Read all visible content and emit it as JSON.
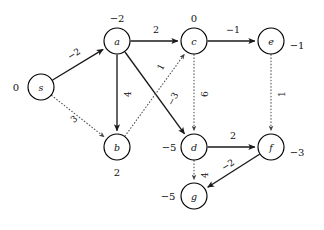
{
  "figure": {
    "background_color": "#ffffff",
    "solid_edge_color": "#1a1a1a",
    "dotted_edge_color": "#555555",
    "node_fill_color": "#ffffff",
    "node_stroke_color": "#000000"
  },
  "nodes": [
    {
      "id": "s",
      "name": "s",
      "value": "0",
      "cx": 41,
      "cy": 87,
      "r": 13,
      "value_x": 16,
      "value_y": 87
    },
    {
      "id": "a",
      "name": "a",
      "value": "−2",
      "cx": 117,
      "cy": 41,
      "r": 13,
      "value_x": 117,
      "value_y": 18
    },
    {
      "id": "b",
      "name": "b",
      "value": "2",
      "cx": 117,
      "cy": 147,
      "r": 13,
      "value_x": 117,
      "value_y": 172
    },
    {
      "id": "c",
      "name": "c",
      "value": "0",
      "cx": 194,
      "cy": 41,
      "r": 13,
      "value_x": 194,
      "value_y": 18
    },
    {
      "id": "d",
      "name": "d",
      "value": "−5",
      "cx": 194,
      "cy": 147,
      "r": 13,
      "value_x": 169,
      "value_y": 147
    },
    {
      "id": "e",
      "name": "e",
      "value": "−1",
      "cx": 271,
      "cy": 41,
      "r": 13,
      "value_x": 297,
      "value_y": 45
    },
    {
      "id": "f",
      "name": "f",
      "value": "−3",
      "cx": 271,
      "cy": 147,
      "r": 13,
      "value_x": 297,
      "value_y": 152
    },
    {
      "id": "g",
      "name": "g",
      "value": "−5",
      "cx": 194,
      "cy": 196,
      "r": 13,
      "value_x": 168,
      "value_y": 196
    }
  ],
  "edges": [
    {
      "id": "s-a",
      "from": "s",
      "to": "a",
      "weight": "−2",
      "style": "solid",
      "label_x": 74,
      "label_y": 54,
      "label_rotate": -32
    },
    {
      "id": "s-b",
      "from": "s",
      "to": "b",
      "weight": "3",
      "style": "dotted",
      "label_x": 74,
      "label_y": 119,
      "label_rotate": -40
    },
    {
      "id": "a-c",
      "from": "a",
      "to": "c",
      "weight": "2",
      "style": "solid",
      "label_x": 156,
      "label_y": 29,
      "label_rotate": 0
    },
    {
      "id": "a-b",
      "from": "a",
      "to": "b",
      "weight": "4",
      "style": "solid",
      "label_x": 128,
      "label_y": 94,
      "label_rotate": -90
    },
    {
      "id": "a-d",
      "from": "a",
      "to": "d",
      "weight": "−3",
      "style": "solid",
      "label_x": 173,
      "label_y": 99,
      "label_rotate": -62
    },
    {
      "id": "c-e",
      "from": "c",
      "to": "e",
      "weight": "−1",
      "style": "solid",
      "label_x": 233,
      "label_y": 29,
      "label_rotate": 0
    },
    {
      "id": "b-c",
      "from": "b",
      "to": "c",
      "weight": "1",
      "style": "dotted",
      "label_x": 161,
      "label_y": 67,
      "label_rotate": -62
    },
    {
      "id": "c-d",
      "from": "c",
      "to": "d",
      "weight": "6",
      "style": "dotted",
      "label_x": 205,
      "label_y": 94,
      "label_rotate": -90
    },
    {
      "id": "e-f",
      "from": "e",
      "to": "f",
      "weight": "1",
      "style": "dotted",
      "label_x": 282,
      "label_y": 94,
      "label_rotate": -90
    },
    {
      "id": "d-f",
      "from": "d",
      "to": "f",
      "weight": "2",
      "style": "solid",
      "label_x": 233,
      "label_y": 135,
      "label_rotate": 0
    },
    {
      "id": "f-g",
      "from": "f",
      "to": "g",
      "weight": "−2",
      "style": "solid",
      "label_x": 228,
      "label_y": 165,
      "label_rotate": -32
    },
    {
      "id": "d-g",
      "from": "d",
      "to": "g",
      "weight": "4",
      "style": "dotted",
      "label_x": 205,
      "label_y": 175,
      "label_rotate": -90
    }
  ],
  "chart_data": {
    "type": "diagram",
    "node_values": {
      "s": 0,
      "a": -2,
      "b": 2,
      "c": 0,
      "d": -5,
      "e": -1,
      "f": -3,
      "g": -5
    },
    "edge_weights": [
      {
        "from": "s",
        "to": "a",
        "weight": -2,
        "style": "solid"
      },
      {
        "from": "s",
        "to": "b",
        "weight": 3,
        "style": "dotted"
      },
      {
        "from": "a",
        "to": "c",
        "weight": 2,
        "style": "solid"
      },
      {
        "from": "a",
        "to": "b",
        "weight": 4,
        "style": "solid"
      },
      {
        "from": "a",
        "to": "d",
        "weight": -3,
        "style": "solid"
      },
      {
        "from": "c",
        "to": "e",
        "weight": -1,
        "style": "solid"
      },
      {
        "from": "b",
        "to": "c",
        "weight": 1,
        "style": "dotted"
      },
      {
        "from": "c",
        "to": "d",
        "weight": 6,
        "style": "dotted"
      },
      {
        "from": "e",
        "to": "f",
        "weight": 1,
        "style": "dotted"
      },
      {
        "from": "d",
        "to": "f",
        "weight": 2,
        "style": "solid"
      },
      {
        "from": "f",
        "to": "g",
        "weight": -2,
        "style": "solid"
      },
      {
        "from": "d",
        "to": "g",
        "weight": 4,
        "style": "dotted"
      }
    ]
  }
}
